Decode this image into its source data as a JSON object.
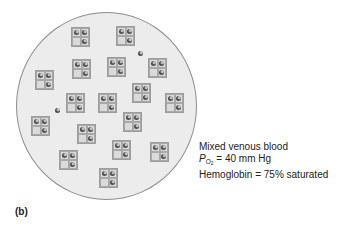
{
  "figure": {
    "panel_label": "(b)",
    "caption": {
      "line1": "Mixed venous blood",
      "line2_symbol": "P",
      "line2_sub": "O",
      "line2_subsub": "2",
      "line2_rest": " = 40 mm Hg",
      "line3": "Hemoglobin = 75% saturated"
    },
    "colors": {
      "circle_fill": "#ececec",
      "circle_border": "#8c8c8c",
      "hb_fill": "#d6d6d6",
      "hb_border": "#9c9c9c",
      "oxygen_dot": "#4a4a4a"
    },
    "hemoglobin_units": [
      {
        "x": 71,
        "y": 27
      },
      {
        "x": 116,
        "y": 26
      },
      {
        "x": 72,
        "y": 59
      },
      {
        "x": 107,
        "y": 57
      },
      {
        "x": 148,
        "y": 58
      },
      {
        "x": 35,
        "y": 70
      },
      {
        "x": 132,
        "y": 83
      },
      {
        "x": 66,
        "y": 93
      },
      {
        "x": 98,
        "y": 93
      },
      {
        "x": 165,
        "y": 93
      },
      {
        "x": 123,
        "y": 112
      },
      {
        "x": 31,
        "y": 116
      },
      {
        "x": 77,
        "y": 124
      },
      {
        "x": 112,
        "y": 140
      },
      {
        "x": 150,
        "y": 142
      },
      {
        "x": 59,
        "y": 150
      },
      {
        "x": 99,
        "y": 168
      }
    ],
    "hemoglobin_pattern": "3 of 4 sites bound (top-left, top-right, bottom-right)",
    "free_oxygen": [
      {
        "x": 138,
        "y": 51
      },
      {
        "x": 55,
        "y": 108
      }
    ]
  }
}
